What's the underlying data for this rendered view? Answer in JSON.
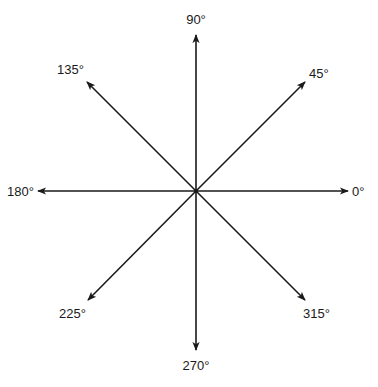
{
  "diagram": {
    "center": [
      196,
      191
    ],
    "line_color": "#1a1a1a",
    "arrows": [
      {
        "angle": 0,
        "label": "0°",
        "tip": [
          348,
          191
        ],
        "label_pos": [
          352,
          196
        ],
        "anchor": "start"
      },
      {
        "angle": 45,
        "label": "45°",
        "tip": [
          305,
          82
        ],
        "label_pos": [
          309,
          78
        ],
        "anchor": "start"
      },
      {
        "angle": 90,
        "label": "90°",
        "tip": [
          196,
          35
        ],
        "label_pos": [
          196,
          24
        ],
        "anchor": "middle"
      },
      {
        "angle": 135,
        "label": "135°",
        "tip": [
          87,
          82
        ],
        "label_pos": [
          84,
          74
        ],
        "anchor": "end"
      },
      {
        "angle": 180,
        "label": "180°",
        "tip": [
          38,
          191
        ],
        "label_pos": [
          34,
          196
        ],
        "anchor": "end"
      },
      {
        "angle": 225,
        "label": "225°",
        "tip": [
          88,
          300
        ],
        "label_pos": [
          86,
          318
        ],
        "anchor": "end"
      },
      {
        "angle": 270,
        "label": "270°",
        "tip": [
          196,
          350
        ],
        "label_pos": [
          196,
          370
        ],
        "anchor": "middle"
      },
      {
        "angle": 315,
        "label": "315°",
        "tip": [
          305,
          300
        ],
        "label_pos": [
          303,
          318
        ],
        "anchor": "start"
      }
    ]
  }
}
